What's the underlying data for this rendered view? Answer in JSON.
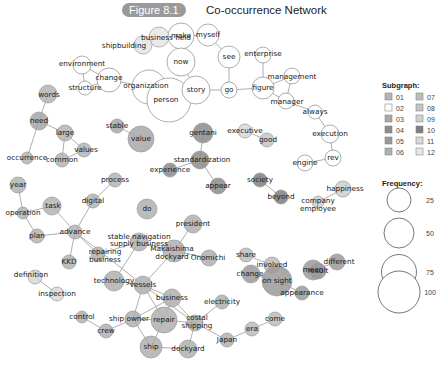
{
  "figure": {
    "badge": "Figure 8.1",
    "title": "Co-occurrence Network"
  },
  "legend": {
    "subgraph_title": "Subgraph:",
    "subgraph": [
      {
        "id": "01",
        "color": "#b4b4b4"
      },
      {
        "id": "02",
        "color": "#ffffff"
      },
      {
        "id": "03",
        "color": "#a8a8a8"
      },
      {
        "id": "04",
        "color": "#8c8c8c"
      },
      {
        "id": "05",
        "color": "#9a9a9a"
      },
      {
        "id": "06",
        "color": "#b0b0b0"
      },
      {
        "id": "07",
        "color": "#bcbcbc"
      },
      {
        "id": "08",
        "color": "#c4c4c4"
      },
      {
        "id": "09",
        "color": "#cfcfcf"
      },
      {
        "id": "10",
        "color": "#7e7e7e"
      },
      {
        "id": "11",
        "color": "#d8d8d8"
      },
      {
        "id": "12",
        "color": "#e6e6e6"
      }
    ],
    "frequency_title": "Frequency:",
    "frequency": [
      {
        "value": "25",
        "r": 12
      },
      {
        "value": "50",
        "r": 15
      },
      {
        "value": "75",
        "r": 17.5
      },
      {
        "value": "100",
        "r": 21
      }
    ]
  },
  "nodes": [
    {
      "id": "business field",
      "x": 159,
      "y": 37,
      "r": 10,
      "fill": "#e6e6e6",
      "lx": 166,
      "ly": 40
    },
    {
      "id": "shipbuilding",
      "x": 143,
      "y": 45,
      "r": 9,
      "fill": "#e6e6e6",
      "lx": 124,
      "ly": 48
    },
    {
      "id": "make",
      "x": 181,
      "y": 36,
      "r": 13,
      "fill": "#ffffff",
      "lx": 181,
      "ly": 38
    },
    {
      "id": "myself",
      "x": 208,
      "y": 35,
      "r": 11,
      "fill": "#ffffff",
      "lx": 208,
      "ly": 37
    },
    {
      "id": "now",
      "x": 181,
      "y": 62,
      "r": 14,
      "fill": "#ffffff",
      "lx": 181,
      "ly": 64
    },
    {
      "id": "see",
      "x": 229,
      "y": 57,
      "r": 11,
      "fill": "#ffffff",
      "lx": 229,
      "ly": 59
    },
    {
      "id": "enterprise",
      "x": 263,
      "y": 55,
      "r": 8,
      "fill": "#ffffff",
      "lx": 263,
      "ly": 56
    },
    {
      "id": "environment",
      "x": 82,
      "y": 65,
      "r": 9,
      "fill": "#ffffff",
      "lx": 82,
      "ly": 66
    },
    {
      "id": "change",
      "x": 109,
      "y": 80,
      "r": 12,
      "fill": "#ffffff",
      "lx": 109,
      "ly": 80
    },
    {
      "id": "structure",
      "x": 85,
      "y": 88,
      "r": 7,
      "fill": "#ffffff",
      "lx": 85,
      "ly": 90
    },
    {
      "id": "organization",
      "x": 149,
      "y": 87,
      "r": 17,
      "fill": "#ffffff",
      "lx": 146,
      "ly": 88
    },
    {
      "id": "person",
      "x": 169,
      "y": 100,
      "r": 22,
      "fill": "#ffffff",
      "lx": 166,
      "ly": 102
    },
    {
      "id": "story",
      "x": 196,
      "y": 90,
      "r": 14,
      "fill": "#ffffff",
      "lx": 196,
      "ly": 92
    },
    {
      "id": "go",
      "x": 229,
      "y": 90,
      "r": 8,
      "fill": "#ffffff",
      "lx": 229,
      "ly": 92
    },
    {
      "id": "figure",
      "x": 263,
      "y": 88,
      "r": 11,
      "fill": "#ffffff",
      "lx": 263,
      "ly": 90
    },
    {
      "id": "management",
      "x": 292,
      "y": 76,
      "r": 8,
      "fill": "#ffffff",
      "lx": 292,
      "ly": 79
    },
    {
      "id": "manager",
      "x": 286,
      "y": 101,
      "r": 8,
      "fill": "#ffffff",
      "lx": 287,
      "ly": 104
    },
    {
      "id": "always",
      "x": 315,
      "y": 112,
      "r": 7,
      "fill": "#ffffff",
      "lx": 315,
      "ly": 114
    },
    {
      "id": "execution",
      "x": 330,
      "y": 134,
      "r": 9,
      "fill": "#ffffff",
      "lx": 330,
      "ly": 136
    },
    {
      "id": "rev",
      "x": 333,
      "y": 158,
      "r": 8,
      "fill": "#ffffff",
      "lx": 333,
      "ly": 160
    },
    {
      "id": "engine",
      "x": 305,
      "y": 163,
      "r": 8,
      "fill": "#ffffff",
      "lx": 305,
      "ly": 165
    },
    {
      "id": "words",
      "x": 48,
      "y": 94,
      "r": 9,
      "fill": "#b4b4b4",
      "lx": 49,
      "ly": 97
    },
    {
      "id": "need",
      "x": 39,
      "y": 121,
      "r": 9,
      "fill": "#a6a6a6",
      "lx": 39,
      "ly": 123
    },
    {
      "id": "large",
      "x": 65,
      "y": 133,
      "r": 8,
      "fill": "#b4b4b4",
      "lx": 65,
      "ly": 135
    },
    {
      "id": "values",
      "x": 84,
      "y": 150,
      "r": 7,
      "fill": "#b4b4b4",
      "lx": 86,
      "ly": 152
    },
    {
      "id": "common",
      "x": 62,
      "y": 160,
      "r": 7,
      "fill": "#b4b4b4",
      "lx": 62,
      "ly": 162
    },
    {
      "id": "occurrence",
      "x": 27,
      "y": 158,
      "r": 6,
      "fill": "#b4b4b4",
      "lx": 27,
      "ly": 160
    },
    {
      "id": "stable",
      "x": 117,
      "y": 126,
      "r": 7,
      "fill": "#a8a8a8",
      "lx": 117,
      "ly": 128
    },
    {
      "id": "value",
      "x": 141,
      "y": 139,
      "r": 13,
      "fill": "#a8a8a8",
      "lx": 141,
      "ly": 141
    },
    {
      "id": "gentani",
      "x": 203,
      "y": 133,
      "r": 10,
      "fill": "#8c8c8c",
      "lx": 203,
      "ly": 135
    },
    {
      "id": "standardization",
      "x": 200,
      "y": 160,
      "r": 9,
      "fill": "#8c8c8c",
      "lx": 202,
      "ly": 162
    },
    {
      "id": "experience",
      "x": 170,
      "y": 170,
      "r": 7,
      "fill": "#8c8c8c",
      "lx": 170,
      "ly": 172
    },
    {
      "id": "appear",
      "x": 218,
      "y": 186,
      "r": 8,
      "fill": "#8c8c8c",
      "lx": 218,
      "ly": 188
    },
    {
      "id": "executive",
      "x": 245,
      "y": 131,
      "r": 7,
      "fill": "#d8d8d8",
      "lx": 245,
      "ly": 133
    },
    {
      "id": "good",
      "x": 267,
      "y": 140,
      "r": 7,
      "fill": "#c4c4c4",
      "lx": 268,
      "ly": 142
    },
    {
      "id": "society",
      "x": 260,
      "y": 180,
      "r": 7,
      "fill": "#7e7e7e",
      "lx": 260,
      "ly": 182
    },
    {
      "id": "beyond",
      "x": 281,
      "y": 197,
      "r": 7,
      "fill": "#7e7e7e",
      "lx": 281,
      "ly": 199
    },
    {
      "id": "happiness",
      "x": 343,
      "y": 189,
      "r": 8,
      "fill": "#cfcfcf",
      "lx": 345,
      "ly": 191
    },
    {
      "id": "company employee",
      "x": 318,
      "y": 202,
      "r": 6,
      "fill": "#cfcfcf",
      "lx": 318,
      "ly": 203,
      "lx2": 318,
      "ly2": 211,
      "l1": "company",
      "l2": "employee"
    },
    {
      "id": "year",
      "x": 18,
      "y": 185,
      "r": 8,
      "fill": "#b4b4b4",
      "lx": 18,
      "ly": 187
    },
    {
      "id": "task",
      "x": 52,
      "y": 206,
      "r": 9,
      "fill": "#b4b4b4",
      "lx": 53,
      "ly": 208
    },
    {
      "id": "operation",
      "x": 23,
      "y": 213,
      "r": 6,
      "fill": "#b4b4b4",
      "lx": 23,
      "ly": 215
    },
    {
      "id": "process",
      "x": 115,
      "y": 180,
      "r": 7,
      "fill": "#b4b4b4",
      "lx": 115,
      "ly": 182
    },
    {
      "id": "digital",
      "x": 93,
      "y": 201,
      "r": 7,
      "fill": "#b4b4b4",
      "lx": 93,
      "ly": 203
    },
    {
      "id": "advance",
      "x": 75,
      "y": 232,
      "r": 7,
      "fill": "#b4b4b4",
      "lx": 75,
      "ly": 234
    },
    {
      "id": "plan",
      "x": 37,
      "y": 236,
      "r": 7,
      "fill": "#b4b4b4",
      "lx": 37,
      "ly": 238
    },
    {
      "id": "KKD",
      "x": 69,
      "y": 262,
      "r": 7,
      "fill": "#b4b4b4",
      "lx": 69,
      "ly": 264
    },
    {
      "id": "do",
      "x": 147,
      "y": 209,
      "r": 10,
      "fill": "#b0b0b0",
      "lx": 147,
      "ly": 211
    },
    {
      "id": "president",
      "x": 193,
      "y": 224,
      "r": 9,
      "fill": "#b0b0b0",
      "lx": 193,
      "ly": 226
    },
    {
      "id": "stable navigation supply business",
      "x": 139,
      "y": 242,
      "r": 9,
      "fill": "#b0b0b0",
      "lx": 139,
      "ly": 239,
      "lx2": 139,
      "ly2": 246,
      "l1": "stable navigation",
      "l2": "supply business"
    },
    {
      "id": "repairing business",
      "x": 98,
      "y": 254,
      "r": 7,
      "fill": "#b0b0b0",
      "lx": 105,
      "ly": 254,
      "lx2": 105,
      "ly2": 262,
      "l1": "repairing",
      "l2": "business"
    },
    {
      "id": "Makaishima dockyard",
      "x": 174,
      "y": 251,
      "r": 11,
      "fill": "#b0b0b0",
      "lx": 172,
      "ly": 251,
      "lx2": 172,
      "ly2": 259,
      "l1": "Makaishima",
      "l2": "dockyard"
    },
    {
      "id": "Onomichi",
      "x": 209,
      "y": 258,
      "r": 8,
      "fill": "#b0b0b0",
      "lx": 208,
      "ly": 260
    },
    {
      "id": "share",
      "x": 246,
      "y": 255,
      "r": 7,
      "fill": "#bcbcbc",
      "lx": 246,
      "ly": 257
    },
    {
      "id": "involved",
      "x": 272,
      "y": 265,
      "r": 8,
      "fill": "#bcbcbc",
      "lx": 272,
      "ly": 267
    },
    {
      "id": "mean",
      "x": 313,
      "y": 270,
      "r": 10,
      "fill": "#9a9a9a",
      "lx": 313,
      "ly": 272
    },
    {
      "id": "different",
      "x": 337,
      "y": 262,
      "r": 8,
      "fill": "#9a9a9a",
      "lx": 339,
      "ly": 264
    },
    {
      "id": "technology",
      "x": 114,
      "y": 281,
      "r": 10,
      "fill": "#b0b0b0",
      "lx": 114,
      "ly": 283
    },
    {
      "id": "vessels",
      "x": 143,
      "y": 285,
      "r": 9,
      "fill": "#b0b0b0",
      "lx": 143,
      "ly": 287
    },
    {
      "id": "change ",
      "x": 251,
      "y": 274,
      "r": 9,
      "fill": "#9a9a9a",
      "lx": 250,
      "ly": 276
    },
    {
      "id": "on sight",
      "x": 277,
      "y": 281,
      "r": 15,
      "fill": "#9a9a9a",
      "lx": 277,
      "ly": 283
    },
    {
      "id": "result",
      "x": 318,
      "y": 271,
      "r": 8,
      "fill": "#9a9a9a",
      "lx": 318,
      "ly": 273,
      "hidden": true
    },
    {
      "id": "result2",
      "x": 318,
      "y": 272,
      "r": 0,
      "fill": "#9a9a9a",
      "hidden": true
    },
    {
      "id": "definition",
      "x": 35,
      "y": 277,
      "r": 7,
      "fill": "#d8d8d8",
      "lx": 31,
      "ly": 277
    },
    {
      "id": "inspection",
      "x": 57,
      "y": 294,
      "r": 7,
      "fill": "#d8d8d8",
      "lx": 57,
      "ly": 296
    },
    {
      "id": "business",
      "x": 172,
      "y": 298,
      "r": 9,
      "fill": "#b0b0b0",
      "lx": 172,
      "ly": 300
    },
    {
      "id": "electricity",
      "x": 222,
      "y": 302,
      "r": 7,
      "fill": "#b0b0b0",
      "lx": 222,
      "ly": 304
    },
    {
      "id": "appearance",
      "x": 302,
      "y": 293,
      "r": 7,
      "fill": "#9a9a9a",
      "lx": 302,
      "ly": 295
    },
    {
      "id": "result ",
      "x": 319,
      "y": 271,
      "r": 0,
      "fill": "#9a9a9a",
      "hidden": true
    },
    {
      "id": "control",
      "x": 82,
      "y": 317,
      "r": 6,
      "fill": "#b0b0b0",
      "lx": 82,
      "ly": 319
    },
    {
      "id": "crew",
      "x": 106,
      "y": 331,
      "r": 7,
      "fill": "#b0b0b0",
      "lx": 106,
      "ly": 333
    },
    {
      "id": "ship owner",
      "x": 133,
      "y": 319,
      "r": 8,
      "fill": "#b0b0b0",
      "lx": 129,
      "ly": 321
    },
    {
      "id": "repair",
      "x": 164,
      "y": 320,
      "r": 13,
      "fill": "#b0b0b0",
      "lx": 164,
      "ly": 322
    },
    {
      "id": "costal shipping",
      "x": 195,
      "y": 323,
      "r": 8,
      "fill": "#b0b0b0",
      "lx": 197,
      "ly": 320,
      "lx2": 197,
      "ly2": 328,
      "l1": "costal",
      "l2": "shipping"
    },
    {
      "id": "ship",
      "x": 151,
      "y": 347,
      "r": 11,
      "fill": "#b0b0b0",
      "lx": 151,
      "ly": 349
    },
    {
      "id": "dockyard",
      "x": 188,
      "y": 349,
      "r": 9,
      "fill": "#b0b0b0",
      "lx": 188,
      "ly": 351
    },
    {
      "id": "Japan",
      "x": 227,
      "y": 340,
      "r": 7,
      "fill": "#b0b0b0",
      "lx": 227,
      "ly": 342
    },
    {
      "id": "era",
      "x": 252,
      "y": 329,
      "r": 7,
      "fill": "#bcbcbc",
      "lx": 252,
      "ly": 331
    },
    {
      "id": "come",
      "x": 275,
      "y": 319,
      "r": 7,
      "fill": "#bcbcbc",
      "lx": 275,
      "ly": 321
    }
  ],
  "labels_extra": [
    {
      "text": "result",
      "x": 318,
      "y": 273
    }
  ],
  "edges": [
    [
      "shipbuilding",
      "business field"
    ],
    [
      "business field",
      "make"
    ],
    [
      "make",
      "myself"
    ],
    [
      "make",
      "now"
    ],
    [
      "now",
      "story"
    ],
    [
      "myself",
      "see"
    ],
    [
      "see",
      "go"
    ],
    [
      "story",
      "go"
    ],
    [
      "story",
      "person"
    ],
    [
      "person",
      "organization"
    ],
    [
      "organization",
      "change"
    ],
    [
      "change",
      "environment"
    ],
    [
      "change",
      "structure"
    ],
    [
      "environment",
      "structure"
    ],
    [
      "go",
      "figure"
    ],
    [
      "figure",
      "enterprise"
    ],
    [
      "figure",
      "management"
    ],
    [
      "figure",
      "manager"
    ],
    [
      "management",
      "manager"
    ],
    [
      "manager",
      "always"
    ],
    [
      "always",
      "execution"
    ],
    [
      "execution",
      "rev"
    ],
    [
      "rev",
      "engine"
    ],
    [
      "words",
      "need"
    ],
    [
      "need",
      "large"
    ],
    [
      "need",
      "occurrence"
    ],
    [
      "large",
      "common"
    ],
    [
      "large",
      "values"
    ],
    [
      "values",
      "common"
    ],
    [
      "stable",
      "value"
    ],
    [
      "gentani",
      "standardization"
    ],
    [
      "standardization",
      "experience"
    ],
    [
      "standardization",
      "appear"
    ],
    [
      "executive",
      "good"
    ],
    [
      "society",
      "beyond"
    ],
    [
      "happiness",
      "company employee"
    ],
    [
      "year",
      "operation"
    ],
    [
      "operation",
      "task"
    ],
    [
      "operation",
      "plan"
    ],
    [
      "process",
      "digital"
    ],
    [
      "digital",
      "advance"
    ],
    [
      "task",
      "advance"
    ],
    [
      "advance",
      "plan"
    ],
    [
      "advance",
      "KKD"
    ],
    [
      "advance",
      "repairing business"
    ],
    [
      "advance",
      "vessels"
    ],
    [
      "president",
      "Makaishima dockyard"
    ],
    [
      "stable navigation supply business",
      "repairing business"
    ],
    [
      "stable navigation supply business",
      "technology"
    ],
    [
      "stable navigation supply business",
      "Makaishima dockyard"
    ],
    [
      "Makaishima dockyard",
      "Onomichi"
    ],
    [
      "Makaishima dockyard",
      "vessels"
    ],
    [
      "technology",
      "vessels"
    ],
    [
      "share",
      "involved"
    ],
    [
      "mean",
      "different"
    ],
    [
      "mean",
      "result ",
      "x"
    ],
    [
      "change ",
      "on sight"
    ],
    [
      "on sight",
      "appearance"
    ],
    [
      "definition",
      "inspection"
    ],
    [
      "vessels",
      "business"
    ],
    [
      "vessels",
      "ship owner"
    ],
    [
      "vessels",
      "repair"
    ],
    [
      "vessels",
      "costal shipping"
    ],
    [
      "business",
      "repair"
    ],
    [
      "business",
      "costal shipping"
    ],
    [
      "ship owner",
      "repair"
    ],
    [
      "ship owner",
      "business"
    ],
    [
      "ship owner",
      "crew"
    ],
    [
      "ship owner",
      "ship"
    ],
    [
      "crew",
      "control"
    ],
    [
      "repair",
      "ship"
    ],
    [
      "repair",
      "costal shipping"
    ],
    [
      "ship",
      "dockyard"
    ],
    [
      "dockyard",
      "costal shipping"
    ],
    [
      "costal shipping",
      "Japan"
    ],
    [
      "costal shipping",
      "electricity"
    ],
    [
      "Japan",
      "era"
    ],
    [
      "era",
      "come"
    ]
  ]
}
